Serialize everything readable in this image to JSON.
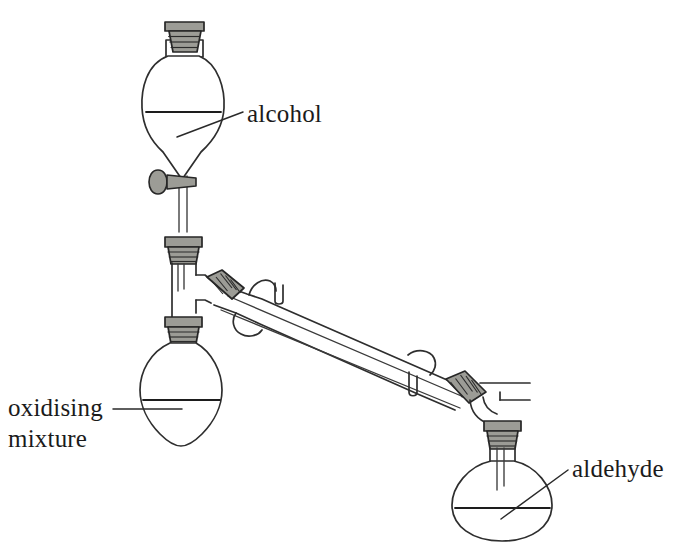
{
  "diagram": {
    "background_color": "#ffffff",
    "glass_outline_color": "#2e2e2e",
    "ground_glass_joint_color": "#9c9c96",
    "label_text_color": "#1b1b1b"
  },
  "labels": {
    "alcohol": "alcohol",
    "oxidising_line1": "oxidising",
    "oxidising_line2": "mixture",
    "aldehyde": "aldehyde"
  },
  "components": {
    "dropping_funnel": "dropping-funnel",
    "funnel_stopper": "ground-glass-stopper",
    "stopcock": "stopcock-tap",
    "t_piece": "t-piece-adapter",
    "reaction_flask": "pear-shaped-reaction-flask",
    "condenser": "liebig-condenser",
    "water_outlet": "condenser-water-outlet",
    "water_inlet": "condenser-water-inlet",
    "receiving_flask": "round-bottom-receiving-flask",
    "delivery_tube": "delivery-tube"
  }
}
